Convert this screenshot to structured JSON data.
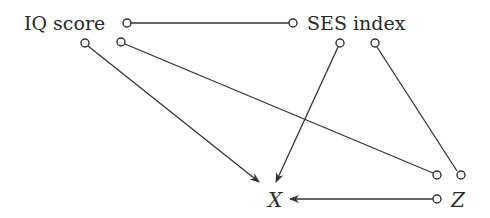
{
  "diagram": {
    "type": "causal-graph",
    "nodes": {
      "iq": {
        "label": "IQ score"
      },
      "ses": {
        "label": "SES index"
      },
      "x": {
        "label": "X"
      },
      "z": {
        "label": "Z"
      }
    },
    "edges": [
      {
        "from": "IQ score",
        "to": "SES index",
        "style": "undirected"
      },
      {
        "from": "IQ score",
        "to": "X",
        "style": "directed"
      },
      {
        "from": "SES index",
        "to": "X",
        "style": "directed"
      },
      {
        "from": "IQ score",
        "to": "Z",
        "style": "undirected"
      },
      {
        "from": "SES index",
        "to": "Z",
        "style": "undirected"
      },
      {
        "from": "Z",
        "to": "X",
        "style": "directed"
      }
    ],
    "colors": {
      "line": "#333333",
      "text": "#2a2a2a",
      "background": "#ffffff"
    }
  }
}
